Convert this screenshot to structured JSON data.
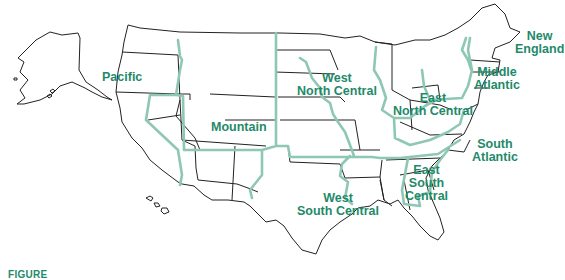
{
  "map": {
    "title": "U.S. Census Divisions",
    "colors": {
      "label": "#1f8a6a",
      "region_border": "#8ec8b4",
      "state_border": "#222222"
    },
    "regions": [
      {
        "name": "Pacific",
        "label_lines": [
          "Pacific"
        ]
      },
      {
        "name": "Mountain",
        "label_lines": [
          "Mountain"
        ]
      },
      {
        "name": "West North Central",
        "label_lines": [
          "West",
          "North Central"
        ]
      },
      {
        "name": "East North Central",
        "label_lines": [
          "East",
          "North Central"
        ]
      },
      {
        "name": "Middle Atlantic",
        "label_lines": [
          "Middle",
          "Atlantic"
        ]
      },
      {
        "name": "New England",
        "label_lines": [
          "New",
          "England"
        ]
      },
      {
        "name": "South Atlantic",
        "label_lines": [
          "South",
          "Atlantic"
        ]
      },
      {
        "name": "East South Central",
        "label_lines": [
          "East",
          "South",
          "Central"
        ]
      },
      {
        "name": "West South Central",
        "label_lines": [
          "West",
          "South Central"
        ]
      }
    ]
  },
  "caption": {
    "text": "FIGURE"
  }
}
